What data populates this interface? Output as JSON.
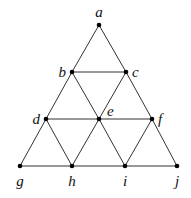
{
  "diagram": {
    "type": "triangular-grid-graph",
    "nodes": [
      {
        "id": "a",
        "label": "a",
        "x": 99,
        "y": 25,
        "lx": 99,
        "ly": 17,
        "anchor": "middle"
      },
      {
        "id": "b",
        "label": "b",
        "x": 72,
        "y": 72,
        "lx": 66,
        "ly": 77,
        "anchor": "end"
      },
      {
        "id": "c",
        "label": "c",
        "x": 126,
        "y": 72,
        "lx": 132,
        "ly": 77,
        "anchor": "start"
      },
      {
        "id": "d",
        "label": "d",
        "x": 46,
        "y": 119,
        "lx": 40,
        "ly": 124,
        "anchor": "end"
      },
      {
        "id": "e",
        "label": "e",
        "x": 99,
        "y": 119,
        "lx": 107,
        "ly": 116,
        "anchor": "start"
      },
      {
        "id": "f",
        "label": "f",
        "x": 152,
        "y": 119,
        "lx": 158,
        "ly": 124,
        "anchor": "start"
      },
      {
        "id": "g",
        "label": "g",
        "x": 20,
        "y": 166,
        "lx": 20,
        "ly": 186,
        "anchor": "middle"
      },
      {
        "id": "h",
        "label": "h",
        "x": 72,
        "y": 166,
        "lx": 72,
        "ly": 186,
        "anchor": "middle"
      },
      {
        "id": "i",
        "label": "i",
        "x": 125,
        "y": 166,
        "lx": 125,
        "ly": 186,
        "anchor": "middle"
      },
      {
        "id": "j",
        "label": "j",
        "x": 177,
        "y": 166,
        "lx": 177,
        "ly": 186,
        "anchor": "middle"
      }
    ],
    "edges": [
      [
        "a",
        "b"
      ],
      [
        "a",
        "c"
      ],
      [
        "b",
        "c"
      ],
      [
        "b",
        "d"
      ],
      [
        "b",
        "e"
      ],
      [
        "c",
        "e"
      ],
      [
        "c",
        "f"
      ],
      [
        "d",
        "e"
      ],
      [
        "e",
        "f"
      ],
      [
        "d",
        "g"
      ],
      [
        "d",
        "h"
      ],
      [
        "e",
        "h"
      ],
      [
        "e",
        "i"
      ],
      [
        "f",
        "i"
      ],
      [
        "f",
        "j"
      ],
      [
        "g",
        "h"
      ],
      [
        "h",
        "i"
      ],
      [
        "i",
        "j"
      ]
    ]
  }
}
